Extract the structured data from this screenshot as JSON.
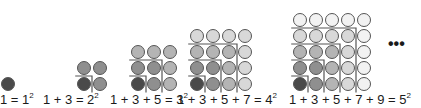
{
  "diagram": {
    "shade_colors": [
      "#4a4a4a",
      "#8f8f8f",
      "#b4b4b4",
      "#d8d8d8",
      "#f2f2f2"
    ],
    "stroke_color": "#555555",
    "line_color": "#555555",
    "steps": [
      {
        "n": 1,
        "label_sum": "1 = 1",
        "exp": "2"
      },
      {
        "n": 2,
        "label_sum": "1 + 3 = 2",
        "exp": "2"
      },
      {
        "n": 3,
        "label_sum": "1 + 3 + 5 = 3",
        "exp": "2"
      },
      {
        "n": 4,
        "label_sum": "1 + 3 + 5 + 7 = 4",
        "exp": "2"
      },
      {
        "n": 5,
        "label_sum": "1 + 3 + 5 + 7 + 9 = 5",
        "exp": "2"
      }
    ],
    "continuation": "•••"
  }
}
